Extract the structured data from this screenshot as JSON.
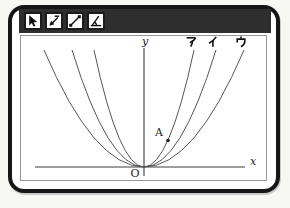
{
  "colors": {
    "titlebar": "#2e2e2e",
    "window_border": "#161616",
    "curve": "#565656",
    "axis": "#3c3c3c"
  },
  "toolbar": {
    "tools": [
      {
        "icon": "cursor-arrow-icon"
      },
      {
        "icon": "arrow-bar-icon"
      },
      {
        "icon": "segment-endpoints-icon"
      },
      {
        "icon": "angle-arc-icon"
      }
    ]
  },
  "graph": {
    "y_axis_label": "y",
    "x_axis_label": "x",
    "origin_label": "O",
    "point_a_label": "A",
    "curves": [
      {
        "label": "ア",
        "half_width": 50
      },
      {
        "label": "イ",
        "half_width": 72
      },
      {
        "label": "ウ",
        "half_width": 100
      }
    ]
  }
}
